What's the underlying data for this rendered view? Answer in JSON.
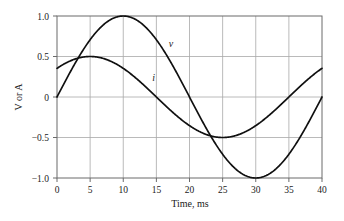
{
  "chart_data": {
    "type": "line",
    "title": "",
    "xlabel": "Time, ms",
    "ylabel": "V or A",
    "xlim": [
      0,
      40
    ],
    "ylim": [
      -1.0,
      1.0
    ],
    "xticks": [
      0,
      5,
      10,
      15,
      20,
      25,
      30,
      35,
      40
    ],
    "xtick_labels": [
      "0",
      "5",
      "10",
      "15",
      "20",
      "25",
      "30",
      "35",
      "40"
    ],
    "yticks": [
      1.0,
      0.5,
      0,
      -0.5,
      -1.0
    ],
    "ytick_labels": [
      "1.0",
      "0.5",
      "0",
      "-0.5",
      "-1.0"
    ],
    "grid": true,
    "legend_position": "inline-annotation",
    "curve_color": "#101010",
    "grid_color": "#a8a8a8",
    "axis_color": "#6b6b6b",
    "series": [
      {
        "name": "v",
        "label": "v",
        "amplitude": 1.0,
        "period_ms": 40,
        "phase_deg": 0,
        "label_x": 17.2,
        "label_y": 0.62,
        "x": [
          0,
          1,
          2,
          3,
          4,
          5,
          6,
          7,
          8,
          9,
          10,
          11,
          12,
          13,
          14,
          15,
          16,
          17,
          18,
          19,
          20,
          21,
          22,
          23,
          24,
          25,
          26,
          27,
          28,
          29,
          30,
          31,
          32,
          33,
          34,
          35,
          36,
          37,
          38,
          39,
          40
        ],
        "values": [
          0.0,
          0.156,
          0.309,
          0.454,
          0.588,
          0.707,
          0.809,
          0.891,
          0.951,
          0.988,
          1.0,
          0.988,
          0.951,
          0.891,
          0.809,
          0.707,
          0.588,
          0.454,
          0.309,
          0.156,
          0.0,
          -0.156,
          -0.309,
          -0.454,
          -0.588,
          -0.707,
          -0.809,
          -0.891,
          -0.951,
          -0.988,
          -1.0,
          -0.988,
          -0.951,
          -0.891,
          -0.809,
          -0.707,
          -0.588,
          -0.454,
          -0.309,
          -0.156,
          0.0
        ]
      },
      {
        "name": "i",
        "label": "i",
        "amplitude": 0.5,
        "period_ms": 40,
        "phase_deg": 45,
        "label_x": 14.6,
        "label_y": 0.2,
        "x": [
          0,
          1,
          2,
          3,
          4,
          5,
          6,
          7,
          8,
          9,
          10,
          11,
          12,
          13,
          14,
          15,
          16,
          17,
          18,
          19,
          20,
          21,
          22,
          23,
          24,
          25,
          26,
          27,
          28,
          29,
          30,
          31,
          32,
          33,
          34,
          35,
          36,
          37,
          38,
          39,
          40
        ],
        "values": [
          0.354,
          0.405,
          0.446,
          0.477,
          0.494,
          0.5,
          0.494,
          0.477,
          0.446,
          0.405,
          0.354,
          0.294,
          0.227,
          0.156,
          0.078,
          0.0,
          -0.078,
          -0.156,
          -0.227,
          -0.294,
          -0.354,
          -0.405,
          -0.446,
          -0.477,
          -0.494,
          -0.5,
          -0.494,
          -0.477,
          -0.446,
          -0.405,
          -0.354,
          -0.294,
          -0.227,
          -0.156,
          -0.078,
          0.0,
          0.078,
          0.156,
          0.227,
          0.294,
          0.354
        ]
      }
    ]
  }
}
